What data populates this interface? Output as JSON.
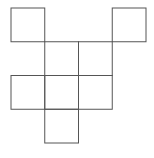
{
  "diagram": {
    "stroke_color": "#555555",
    "background": "#ffffff",
    "grid": {
      "origin_x": 11,
      "origin_y": 8,
      "cell": 33.75
    },
    "squares": [
      {
        "col": 0,
        "row": 0
      },
      {
        "col": 3,
        "row": 0
      },
      {
        "col": 1,
        "row": 1
      },
      {
        "col": 2,
        "row": 1
      },
      {
        "col": 0,
        "row": 2
      },
      {
        "col": 1,
        "row": 2
      },
      {
        "col": 2,
        "row": 2
      },
      {
        "col": 1,
        "row": 3
      }
    ]
  }
}
